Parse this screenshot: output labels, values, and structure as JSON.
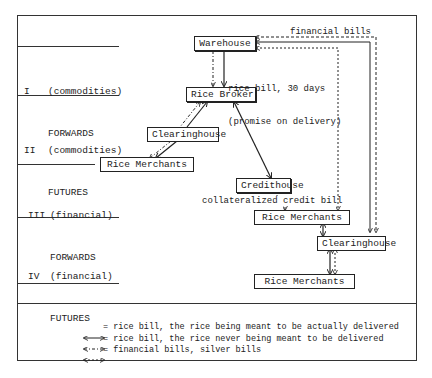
{
  "rows": [
    {
      "numeral": "I",
      "kind": "(commodities)",
      "type": "FORWARDS"
    },
    {
      "numeral": "II",
      "kind": "(commodities)",
      "type": "FUTURES"
    },
    {
      "numeral": "III",
      "kind": "(financial)",
      "type": "FORWARDS"
    },
    {
      "numeral": "IV",
      "kind": "(financial)",
      "type": "FUTURES"
    }
  ],
  "nodes": {
    "warehouse": "Warehouse",
    "rice_broker": "Rice Broker",
    "clearinghouse_1": "Clearinghouse",
    "rice_merchants_1": "Rice Merchants",
    "credithouse": "Credithouse",
    "rice_merchants_2": "Rice Merchants",
    "clearinghouse_2": "Clearinghouse",
    "rice_merchants_3": "Rice Merchants"
  },
  "annotations": {
    "financial_bills": "financial bills",
    "rice_bill_line1": "rice bill, 30 days",
    "rice_bill_line2": "(promise on delivery)",
    "collateralized": "collateralized credit bill"
  },
  "legend": [
    {
      "symbol": "solid-double-arrow",
      "text": "= rice bill, the rice being meant to be actually delivered"
    },
    {
      "symbol": "dash-dot-double-arrow",
      "text": "= rice bill, the rice never being meant to be delivered"
    },
    {
      "symbol": "dashed-double-arrow",
      "text": "= financial bills, silver bills"
    }
  ]
}
